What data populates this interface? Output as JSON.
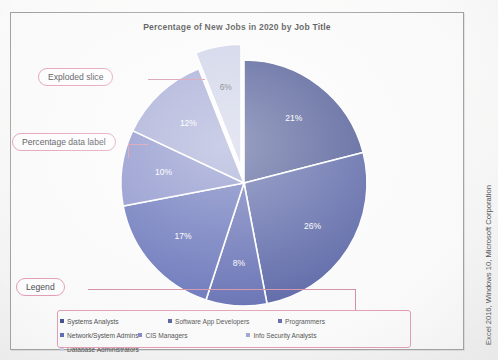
{
  "chart_data": {
    "type": "pie",
    "title": "Percentage of New Jobs in 2020 by Job Title",
    "categories": [
      "Systems Analysts",
      "Software App Developers",
      "Programmers",
      "Network/System Admins",
      "CIS Managers",
      "Info Security Analysts",
      "Database Administrators"
    ],
    "values": [
      21,
      26,
      8,
      17,
      10,
      12,
      6
    ],
    "labels": [
      "21%",
      "26%",
      "8%",
      "17%",
      "10%",
      "12%",
      "6%"
    ],
    "colors": [
      "#21307a",
      "#2e3d8f",
      "#3b49a0",
      "#3f4fa8",
      "#6a73bd",
      "#8d93ca",
      "#c3c8e2"
    ],
    "exploded_slice": "Database Administrators",
    "legend_position": "bottom",
    "grid": false,
    "xlabel": "",
    "ylabel": ""
  },
  "chart": {
    "title": "Percentage of New Jobs in 2020 by Job Title"
  },
  "legend": {
    "items": [
      {
        "label": "Systems Analysts",
        "color": "#21307a"
      },
      {
        "label": "Software App Developers",
        "color": "#2e3d8f"
      },
      {
        "label": "Programmers",
        "color": "#3b49a0"
      },
      {
        "label": "Network/System Admins",
        "color": "#3f4fa8"
      },
      {
        "label": "CIS Managers",
        "color": "#6a73bd"
      },
      {
        "label": "Info Security Analysts",
        "color": "#8d93ca"
      },
      {
        "label": "Database Administrators",
        "color": "#c3c8e2"
      }
    ]
  },
  "annotations": {
    "exploded": "Exploded slice",
    "data_label": "Percentage data label",
    "legend": "Legend",
    "accent_color": "#e08ba8"
  },
  "credit": {
    "text": "Excel 2016, Windows 10, Microsoft Corporation"
  }
}
